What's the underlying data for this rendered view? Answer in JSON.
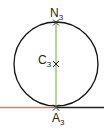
{
  "diagram": {
    "colors": {
      "circle": "#111111",
      "diameter": "#6aaa3a",
      "tangent_left": "#e07a55",
      "tangent_right": "#222222",
      "marker": "#222222"
    },
    "points": [
      {
        "id": "N3",
        "base": "N",
        "sub": "3",
        "x": 56,
        "y": 22
      },
      {
        "id": "C3",
        "base": "C",
        "sub": "3",
        "x": 56,
        "y": 64
      },
      {
        "id": "A3",
        "base": "A",
        "sub": "3",
        "x": 56,
        "y": 107
      }
    ],
    "labels": {
      "n_base": "N",
      "n_sub": "3",
      "c_base": "C",
      "c_sub": "3",
      "a_base": "A",
      "a_sub": "3"
    }
  }
}
